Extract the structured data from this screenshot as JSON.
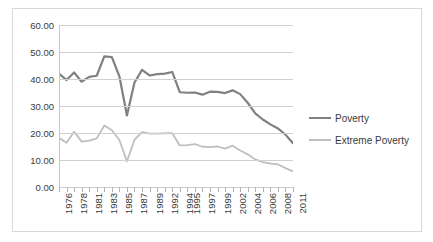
{
  "chart_data": {
    "type": "line",
    "title": "",
    "xlabel": "",
    "ylabel": "",
    "ylim": [
      0,
      60
    ],
    "ytick_labels": [
      "60.00",
      "50.00",
      "40.00",
      "30.00",
      "20.00",
      "10.00",
      "0.00"
    ],
    "ytick_values": [
      60,
      50,
      40,
      30,
      20,
      10,
      0
    ],
    "grid": true,
    "legend_position": "right",
    "x": [
      1976,
      1977,
      1978,
      1979,
      1981,
      1982,
      1983,
      1984,
      1985,
      1986,
      1987,
      1988,
      1989,
      1990,
      1992,
      1993,
      1994,
      1995,
      1996,
      1997,
      1998,
      1999,
      2000,
      2002,
      2003,
      2004,
      2005,
      2006,
      2007,
      2008,
      2009,
      2011
    ],
    "xtick_labels": [
      "1976",
      "",
      "1978",
      "",
      "1981",
      "",
      "1983",
      "",
      "1985",
      "",
      "1987",
      "",
      "1989",
      "",
      "1992",
      "",
      "1994",
      "1995",
      "",
      "1997",
      "",
      "1999",
      "",
      "2002",
      "",
      "2004",
      "",
      "2006",
      "",
      "2008",
      "",
      "2011"
    ],
    "xtick_labels_visible": [
      "1976",
      "1978",
      "1981",
      "1983",
      "1985",
      "1987",
      "1989",
      "1992",
      "1995",
      "1997",
      "1999",
      "2002",
      "2004",
      "2006",
      "2008",
      "2011"
    ],
    "series": [
      {
        "name": "Poverty",
        "color": "#808080",
        "width": 2.2,
        "values": [
          42.0,
          39.6,
          42.4,
          39.0,
          40.8,
          41.2,
          48.4,
          48.1,
          41.0,
          26.5,
          38.7,
          43.4,
          41.3,
          41.8,
          42.0,
          42.6,
          35.1,
          34.9,
          35.0,
          34.2,
          35.3,
          35.2,
          34.8,
          35.8,
          34.4,
          31.2,
          27.3,
          25.0,
          23.2,
          21.7,
          19.4,
          16.2
        ]
      },
      {
        "name": "Extreme Poverty",
        "color": "#bfbfbf",
        "width": 1.8,
        "values": [
          18.2,
          16.4,
          20.5,
          16.8,
          17.2,
          18.0,
          22.8,
          21.0,
          17.4,
          9.5,
          17.5,
          20.3,
          19.8,
          19.8,
          19.9,
          19.9,
          15.4,
          15.5,
          15.9,
          14.9,
          14.8,
          15.0,
          14.2,
          15.3,
          13.5,
          12.1,
          10.2,
          9.2,
          8.7,
          8.4,
          7.0,
          5.8
        ]
      }
    ]
  },
  "legend": {
    "items": [
      {
        "label": "Poverty",
        "color": "#808080"
      },
      {
        "label": "Extreme Poverty",
        "color": "#bfbfbf"
      }
    ]
  }
}
